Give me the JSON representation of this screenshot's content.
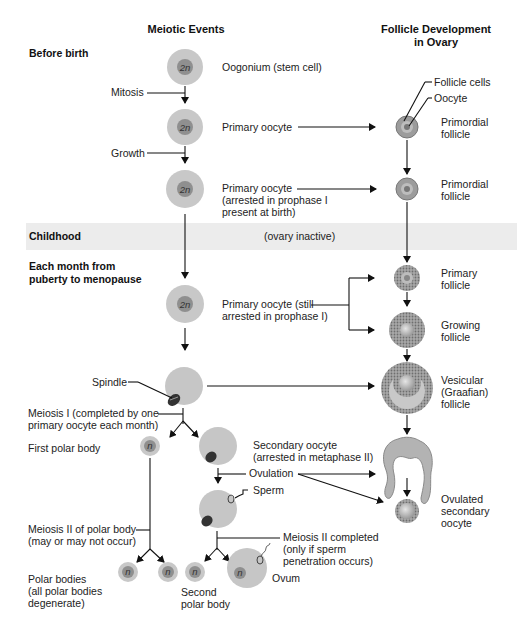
{
  "headers": {
    "meiotic_events": "Meiotic Events",
    "follicle_dev_line1": "Follicle Development",
    "follicle_dev_line2": "in Ovary"
  },
  "stages": {
    "before_birth": "Before birth",
    "childhood": "Childhood",
    "ovary_inactive": "(ovary inactive)",
    "each_month_line1": "Each month from",
    "each_month_line2": "puberty to menopause"
  },
  "ploidy": {
    "diploid": "2n",
    "haploid": "n"
  },
  "meiotic_labels": {
    "oogonium": "Oogonium (stem cell)",
    "mitosis": "Mitosis",
    "primary_oocyte": "Primary oocyte",
    "growth": "Growth",
    "primary_arrested_line1": "Primary oocyte",
    "primary_arrested_line2": "(arrested in prophase I",
    "primary_arrested_line3": "present at birth)",
    "primary_still_line1": "Primary oocyte (still",
    "primary_still_line2": "arrested in prophase I)",
    "spindle": "Spindle",
    "meiosis1_line1": "Meiosis I (completed by one",
    "meiosis1_line2": "primary oocyte each month)",
    "first_polar_body": "First polar body",
    "secondary_line1": "Secondary oocyte",
    "secondary_line2": "(arrested in metaphase II)",
    "ovulation": "Ovulation",
    "sperm": "Sperm",
    "meiosis2_polar_line1": "Meiosis II of polar body",
    "meiosis2_polar_line2": "(may or may not occur)",
    "meiosis2_done_line1": "Meiosis II completed",
    "meiosis2_done_line2": "(only if sperm",
    "meiosis2_done_line3": "penetration occurs)",
    "polar_bodies_line1": "Polar bodies",
    "polar_bodies_line2": "(all polar bodies",
    "polar_bodies_line3": "degenerate)",
    "second_polar_line1": "Second",
    "second_polar_line2": "polar body",
    "ovum": "Ovum"
  },
  "follicle_labels": {
    "follicle_cells": "Follicle cells",
    "oocyte": "Oocyte",
    "primordial_line1": "Primordial",
    "primordial_line2": "follicle",
    "primary_line1": "Primary",
    "primary_line2": "follicle",
    "growing_line1": "Growing",
    "growing_line2": "follicle",
    "vesicular_line1": "Vesicular",
    "vesicular_line2": "(Graafian)",
    "vesicular_line3": "follicle",
    "ovulated_line1": "Ovulated",
    "ovulated_line2": "secondary",
    "ovulated_line3": "oocyte"
  },
  "colors": {
    "cell_outer": "#c8c8c8",
    "cell_inner": "#8f8f8f",
    "childhood_band": "#ececec",
    "line": "#111111"
  }
}
